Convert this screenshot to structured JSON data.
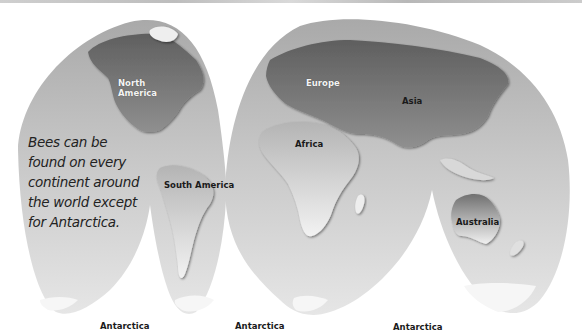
{
  "map": {
    "projection": "interrupted-goode-homolosine",
    "style": "grayscale",
    "colors": {
      "ocean": "#c4c4c4",
      "ocean_light": "#e2e2e2",
      "land_dark": "#6e6e6e",
      "land_mid": "#9a9a9a",
      "land_light": "#ececec",
      "background": "#ffffff",
      "label_dark": "#1a1a1a",
      "label_light": "#f4f4f4"
    },
    "labels": {
      "north_america": [
        "North",
        "America"
      ],
      "europe": "Europe",
      "asia": "Asia",
      "africa": "Africa",
      "south_america": "South America",
      "australia": "Australia",
      "antarctica_1": "Antarctica",
      "antarctica_2": "Antarctica",
      "antarctica_3": "Antarctica"
    },
    "annotation": {
      "lines": [
        "Bees can be",
        "found on every",
        "continent around",
        "the world except",
        "for Antarctica."
      ]
    }
  }
}
